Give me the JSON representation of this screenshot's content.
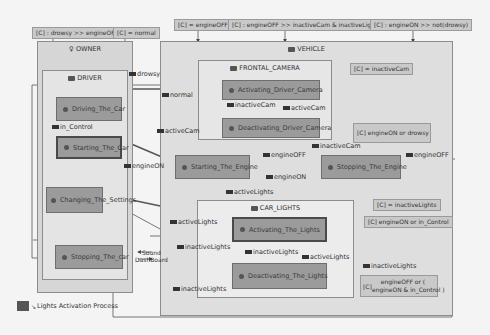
{
  "conditions": {
    "c1": "[C] : drowsy >> engineOFF",
    "c2": "[C] = normal",
    "c3": "[C] = engineOFF",
    "c4": "[C] : engineOFF >> inactiveCam & inactiveLights",
    "c5": "[C] : engineON >> not(drowsy)",
    "c6": "[C] = inactiveCam",
    "c7": "[C] engineON or drowsy",
    "c8": "[C] = inactiveLights",
    "c9": "[C] engineON or in_Control",
    "c10_prefix": "[C]",
    "c10_line1": "engineOFF or (",
    "c10_line2": "engineON & in_Control )"
  },
  "regions": {
    "owner": "OWNER",
    "driver": "DRIVER",
    "vehicle": "VEHICLE",
    "frontal_camera": "FRONTAL_CAMERA",
    "car_lights": "CAR_LIGHTS"
  },
  "states": {
    "driving": "Driving_The_Car",
    "starting_car": "Starting_The_Car",
    "changing": "Changing_The_Settings",
    "stopping_car": "Stopping_The_car",
    "activating_cam": "Activating_Driver_Camera",
    "deactivating_cam": "Deactivating_Driver_Camera",
    "starting_engine": "Starting_The_Engine",
    "stopping_engine": "Stopping_The_Engine",
    "activating_lights": "Activating_The_Lights",
    "deactivating_lights": "Deactivating_The_Lights"
  },
  "labels": {
    "drowsy": "drowsy",
    "normal": "normal",
    "in_control": "in_Control",
    "engineON_1": "engineON",
    "activeCam": "activeCam",
    "inactiveCam_1": "inactiveCam",
    "activeCam_2": "activeCam",
    "inactiveCam_2": "inactiveCam",
    "engineOFF_1": "engineOFF",
    "engineON_2": "engineON",
    "engineOFF_2": "engineOFF",
    "activeLights_1": "activeLights",
    "activeLights_2": "activeLights",
    "inactiveLights_1": "inactiveLights",
    "inactiveLights_2": "inactiveLights",
    "activeLights_3": "activeLights",
    "inactiveLights_3": "inactiveLights",
    "inactiveLights_4": "inactiveLights",
    "sound": "Sound",
    "dashboard": "DashBoard"
  },
  "legend": {
    "label": "Lights Activation Process",
    "color": "#555555"
  }
}
